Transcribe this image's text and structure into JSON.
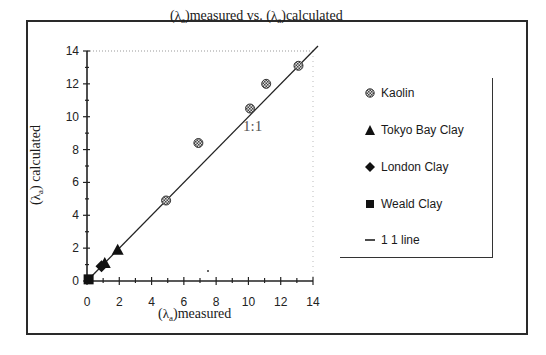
{
  "chart_data": {
    "type": "scatter",
    "title": "(λa)measured vs. (λa)calculated",
    "xlabel": "(λa)measured",
    "ylabel": "(λa) calculated",
    "xlim": [
      0,
      14
    ],
    "ylim": [
      0,
      14
    ],
    "xticks": [
      0,
      2,
      4,
      6,
      8,
      10,
      12,
      14
    ],
    "yticks": [
      0,
      2,
      4,
      6,
      8,
      10,
      12,
      14
    ],
    "grid": false,
    "legend_position": "right",
    "annotation": "1:1",
    "series": [
      {
        "name": "Kaolin",
        "marker": "hatched-circle",
        "points": [
          [
            4.9,
            4.9
          ],
          [
            6.9,
            8.4
          ],
          [
            10.1,
            10.5
          ],
          [
            11.1,
            12.0
          ],
          [
            13.1,
            13.1
          ]
        ]
      },
      {
        "name": "Tokyo Bay Clay",
        "marker": "triangle",
        "points": [
          [
            1.1,
            1.1
          ],
          [
            1.9,
            1.9
          ]
        ]
      },
      {
        "name": "London Clay",
        "marker": "diamond",
        "points": [
          [
            0.9,
            0.9
          ]
        ]
      },
      {
        "name": "Weald Clay",
        "marker": "square",
        "points": [
          [
            0.1,
            0.1
          ]
        ]
      },
      {
        "name": "1 1 line",
        "marker": "line",
        "points": [
          [
            0,
            0
          ],
          [
            14,
            14
          ]
        ]
      }
    ]
  },
  "title": {
    "lambda": "λ",
    "sub": "a",
    "part1": "measured vs. (",
    "part2": "calculated"
  },
  "axes": {
    "x_ticks": [
      "0",
      "2",
      "4",
      "6",
      "8",
      "10",
      "12",
      "14"
    ],
    "y_ticks": [
      "0",
      "2",
      "4",
      "6",
      "8",
      "10",
      "12",
      "14"
    ],
    "xlabel_text": "measured",
    "ylabel_text": " calculated",
    "lambda": "λ",
    "sub": "a"
  },
  "annotation": "1:1",
  "legend": {
    "items": [
      {
        "label": "Kaolin",
        "icon": "hatched-circle-icon"
      },
      {
        "label": "Tokyo Bay Clay",
        "icon": "triangle-icon"
      },
      {
        "label": "London Clay",
        "icon": "diamond-icon"
      },
      {
        "label": "Weald Clay",
        "icon": "square-icon"
      },
      {
        "label": "1 1 line",
        "icon": "line-icon"
      }
    ]
  }
}
